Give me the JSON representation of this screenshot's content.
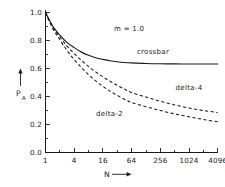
{
  "chart_data": {
    "type": "line",
    "title": "",
    "subtitle": "",
    "xlabel": "N",
    "ylabel": "P",
    "ylabel_sub": "A",
    "xscale": "log2",
    "xticks": [
      "1",
      "4",
      "16",
      "64",
      "256",
      "1024",
      "4096"
    ],
    "xtick_values": [
      1,
      4,
      16,
      64,
      256,
      1024,
      4096
    ],
    "yticks": [
      "0.0",
      "0.2",
      "0.4",
      "0.6",
      "0.8",
      "1.0"
    ],
    "ytick_values": [
      0.0,
      0.2,
      0.4,
      0.6,
      0.8,
      1.0
    ],
    "ylim": [
      0.0,
      1.0
    ],
    "xlim": [
      1,
      4096
    ],
    "grid": false,
    "legend_position": "inline-annotations",
    "annotations": [
      {
        "name": "parameter-note",
        "text": "m = 1.0",
        "x": 64,
        "y": 0.9
      }
    ],
    "series": [
      {
        "name": "crossbar",
        "label": "crossbar",
        "style": "solid",
        "color": "#1a1a1a",
        "label_x": 180,
        "label_y": 0.705,
        "x": [
          1,
          1.4,
          2,
          2.8,
          4,
          5.7,
          8,
          11.3,
          16,
          22.6,
          32,
          45,
          64,
          128,
          256,
          512,
          1024,
          2048,
          4096
        ],
        "y": [
          1.0,
          0.905,
          0.838,
          0.787,
          0.749,
          0.717,
          0.694,
          0.677,
          0.665,
          0.655,
          0.648,
          0.643,
          0.64,
          0.636,
          0.634,
          0.633,
          0.632,
          0.632,
          0.632
        ]
      },
      {
        "name": "delta-4",
        "label": "delta-4",
        "style": "dashed",
        "color": "#1a1a1a",
        "label_x": 1024,
        "label_y": 0.45,
        "x": [
          1,
          1.4,
          2,
          2.8,
          4,
          5.7,
          8,
          11.3,
          16,
          22.6,
          32,
          45,
          64,
          128,
          256,
          512,
          1024,
          2048,
          4096
        ],
        "y": [
          1.0,
          0.9,
          0.825,
          0.762,
          0.706,
          0.657,
          0.614,
          0.576,
          0.541,
          0.509,
          0.48,
          0.453,
          0.428,
          0.396,
          0.366,
          0.34,
          0.318,
          0.3,
          0.285
        ]
      },
      {
        "name": "delta-2",
        "label": "delta-2",
        "style": "dashed",
        "color": "#1a1a1a",
        "label_x": 22,
        "label_y": 0.258,
        "x": [
          1,
          1.4,
          2,
          2.8,
          4,
          5.7,
          8,
          11.3,
          16,
          22.6,
          32,
          45,
          64,
          128,
          256,
          512,
          1024,
          2048,
          4096
        ],
        "y": [
          1.0,
          0.89,
          0.805,
          0.731,
          0.664,
          0.606,
          0.556,
          0.512,
          0.473,
          0.438,
          0.408,
          0.381,
          0.357,
          0.327,
          0.3,
          0.276,
          0.255,
          0.236,
          0.219
        ]
      }
    ]
  },
  "axes": {
    "y_arrow_name": "y-axis-arrow",
    "x_arrow_name": "x-axis-arrow"
  }
}
